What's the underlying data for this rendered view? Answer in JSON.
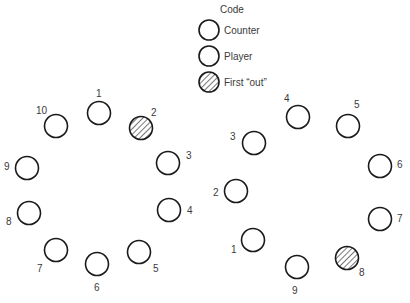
{
  "legend": {
    "title": "Code",
    "items": [
      {
        "label": "Counter",
        "symbol": "open-circle"
      },
      {
        "label": "Player",
        "symbol": "open-circle"
      },
      {
        "label": "First “out”",
        "symbol": "hatched-circle"
      }
    ]
  },
  "left_ring": {
    "players": [
      {
        "n": "1",
        "x": 99,
        "y": 113,
        "out": false
      },
      {
        "n": "2",
        "x": 141,
        "y": 128,
        "out": true
      },
      {
        "n": "3",
        "x": 168,
        "y": 163,
        "out": false
      },
      {
        "n": "4",
        "x": 169,
        "y": 210,
        "out": false
      },
      {
        "n": "5",
        "x": 139,
        "y": 252,
        "out": false
      },
      {
        "n": "6",
        "x": 97,
        "y": 264,
        "out": false
      },
      {
        "n": "7",
        "x": 56,
        "y": 250,
        "out": false
      },
      {
        "n": "8",
        "x": 29,
        "y": 213,
        "out": false
      },
      {
        "n": "9",
        "x": 27,
        "y": 168,
        "out": false
      },
      {
        "n": "10",
        "x": 56,
        "y": 126,
        "out": false
      }
    ]
  },
  "right_ring": {
    "players": [
      {
        "n": "1",
        "x": 253,
        "y": 240,
        "out": false
      },
      {
        "n": "2",
        "x": 236,
        "y": 191,
        "out": false
      },
      {
        "n": "3",
        "x": 254,
        "y": 143,
        "out": false
      },
      {
        "n": "4",
        "x": 298,
        "y": 117,
        "out": false
      },
      {
        "n": "5",
        "x": 348,
        "y": 126,
        "out": false
      },
      {
        "n": "6",
        "x": 380,
        "y": 166,
        "out": false
      },
      {
        "n": "7",
        "x": 380,
        "y": 219,
        "out": false
      },
      {
        "n": "8",
        "x": 347,
        "y": 258,
        "out": true
      },
      {
        "n": "9",
        "x": 297,
        "y": 267,
        "out": false
      }
    ]
  },
  "labels": {
    "left": [
      "1",
      "2",
      "3",
      "4",
      "5",
      "6",
      "7",
      "8",
      "9",
      "10"
    ],
    "right": [
      "1",
      "2",
      "3",
      "4",
      "5",
      "6",
      "7",
      "8",
      "9"
    ]
  },
  "colors": {
    "stroke": "#1a1a1a",
    "text": "#3a3a3a",
    "background": "#ffffff"
  }
}
